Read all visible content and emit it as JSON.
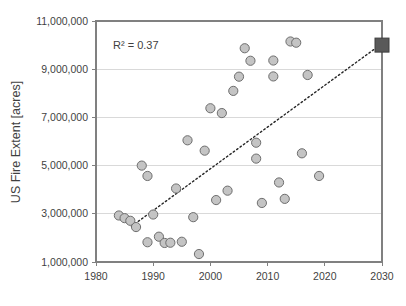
{
  "chart_data": {
    "type": "scatter",
    "title": "",
    "xlabel": "",
    "ylabel": "US Fire Extent [acres]",
    "xlim": [
      1980,
      2030
    ],
    "ylim": [
      1000000,
      11000000
    ],
    "xticks": [
      1980,
      1990,
      2000,
      2010,
      2020,
      2030
    ],
    "xtick_labels": [
      "1980",
      "1990",
      "2000",
      "2010",
      "2020",
      "2030"
    ],
    "yticks": [
      1000000,
      3000000,
      5000000,
      7000000,
      9000000,
      11000000
    ],
    "ytick_labels": [
      "1,000,000",
      "3,000,000",
      "5,000,000",
      "7,000,000",
      "9,000,000",
      "11,000,000"
    ],
    "grid": true,
    "grid_axis": "y",
    "legend": false,
    "annotations": [
      {
        "text": "R² = 0.37",
        "x": 1986.5,
        "y": 10250000
      }
    ],
    "series": [
      {
        "name": "US Fire Extent",
        "marker": "circle",
        "color": "#c4c4c4",
        "edge_color": "#6e6e6e",
        "points": [
          {
            "x": 1984,
            "y": 2930000
          },
          {
            "x": 1985,
            "y": 2820000
          },
          {
            "x": 1986,
            "y": 2710000
          },
          {
            "x": 1987,
            "y": 2450000
          },
          {
            "x": 1988,
            "y": 5000000
          },
          {
            "x": 1989,
            "y": 1820000
          },
          {
            "x": 1989,
            "y": 4570000
          },
          {
            "x": 1990,
            "y": 2970000
          },
          {
            "x": 1991,
            "y": 2050000
          },
          {
            "x": 1992,
            "y": 1790000
          },
          {
            "x": 1993,
            "y": 1800000
          },
          {
            "x": 1994,
            "y": 4050000
          },
          {
            "x": 1995,
            "y": 1840000
          },
          {
            "x": 1996,
            "y": 6050000
          },
          {
            "x": 1997,
            "y": 2860000
          },
          {
            "x": 1998,
            "y": 1330000
          },
          {
            "x": 1999,
            "y": 5620000
          },
          {
            "x": 2000,
            "y": 7380000
          },
          {
            "x": 2001,
            "y": 3570000
          },
          {
            "x": 2002,
            "y": 7180000
          },
          {
            "x": 2003,
            "y": 3960000
          },
          {
            "x": 2004,
            "y": 8100000
          },
          {
            "x": 2005,
            "y": 8690000
          },
          {
            "x": 2006,
            "y": 9870000
          },
          {
            "x": 2007,
            "y": 9350000
          },
          {
            "x": 2008,
            "y": 5950000
          },
          {
            "x": 2008,
            "y": 5290000
          },
          {
            "x": 2009,
            "y": 3450000
          },
          {
            "x": 2011,
            "y": 8700000
          },
          {
            "x": 2011,
            "y": 9360000
          },
          {
            "x": 2012,
            "y": 4300000
          },
          {
            "x": 2013,
            "y": 3620000
          },
          {
            "x": 2014,
            "y": 10150000
          },
          {
            "x": 2015,
            "y": 10100000
          },
          {
            "x": 2016,
            "y": 5510000
          },
          {
            "x": 2017,
            "y": 8760000
          },
          {
            "x": 2019,
            "y": 4570000
          }
        ]
      },
      {
        "name": "Projection",
        "marker": "square",
        "color": "#595959",
        "edge_color": "#3f3f3f",
        "points": [
          {
            "x": 2030,
            "y": 10000000
          }
        ]
      }
    ],
    "trendline": {
      "style": "dotted",
      "color": "#262626",
      "x_start": 1986.2,
      "y_start": 2480000,
      "x_end": 2029.4,
      "y_end": 9960000
    }
  }
}
